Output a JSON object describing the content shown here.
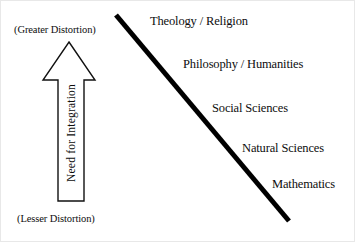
{
  "figure": {
    "background_color": "#ffffff",
    "ink_color": "#0d0d0d",
    "border_color": "#e8e8e8"
  },
  "axis": {
    "top_label": "(Greater Distortion)",
    "bottom_label": "(Lesser Distortion)",
    "arrow_label": "Need for Integration",
    "arrow_direction": "up",
    "arrow_fill": "#ffffff",
    "arrow_stroke": "#111111"
  },
  "diagonal": {
    "name": "diagonal-divider-line",
    "color": "#000000",
    "stroke_width": 5,
    "x1": 115,
    "y1": 14,
    "x2": 288,
    "y2": 220
  },
  "disciplines": [
    {
      "label": "Theology / Religion"
    },
    {
      "label": "Philosophy / Humanities"
    },
    {
      "label": "Social Sciences"
    },
    {
      "label": "Natural Sciences"
    },
    {
      "label": "Mathematics"
    }
  ],
  "chart_data": {
    "type": "diagram",
    "title": "",
    "axis_low": "(Lesser Distortion)",
    "axis_high": "(Greater Distortion)",
    "axis_name": "Need for Integration",
    "categories": [
      "Theology / Religion",
      "Philosophy / Humanities",
      "Social Sciences",
      "Natural Sciences",
      "Mathematics"
    ],
    "ordering": "top = greatest need for integration / greater distortion; bottom = lesser"
  }
}
